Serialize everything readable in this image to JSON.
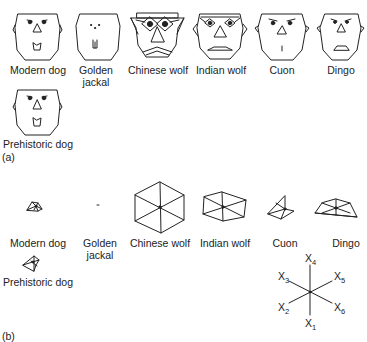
{
  "panel_a": {
    "label": "(a)",
    "title": "Chernoff faces",
    "items": [
      {
        "name": "Modern dog"
      },
      {
        "name": "Golden",
        "name2": "jackal"
      },
      {
        "name": "Chinese wolf"
      },
      {
        "name": "Indian wolf"
      },
      {
        "name": "Cuon"
      },
      {
        "name": "Dingo"
      },
      {
        "name": "Prehistoric dog"
      }
    ]
  },
  "panel_b": {
    "label": "(b)",
    "title": "Star plots",
    "items": [
      {
        "name": "Modern dog"
      },
      {
        "name": "Golden",
        "name2": "jackal"
      },
      {
        "name": "Chinese wolf"
      },
      {
        "name": "Indian wolf"
      },
      {
        "name": "Cuon"
      },
      {
        "name": "Dingo"
      },
      {
        "name": "Prehistoric dog"
      }
    ],
    "key": {
      "axes": [
        {
          "var": "X",
          "sub": "1"
        },
        {
          "var": "X",
          "sub": "2"
        },
        {
          "var": "X",
          "sub": "3"
        },
        {
          "var": "X",
          "sub": "4"
        },
        {
          "var": "X",
          "sub": "5"
        },
        {
          "var": "X",
          "sub": "6"
        }
      ]
    }
  }
}
